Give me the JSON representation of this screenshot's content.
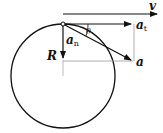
{
  "diagram": {
    "type": "circular-motion-acceleration",
    "labels": {
      "velocity": "v",
      "tangential_accel": "a",
      "tangential_sub": "t",
      "normal_accel": "a",
      "normal_sub": "n",
      "radius": "R",
      "total_accel": "a",
      "angle": "θ"
    },
    "colors": {
      "stroke": "#111111",
      "guide": "#999999"
    }
  }
}
